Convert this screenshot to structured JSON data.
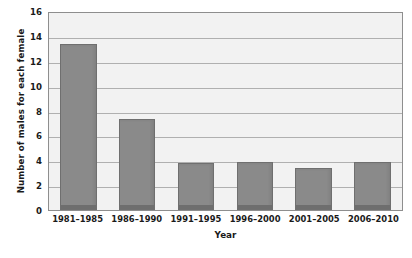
{
  "chart_data": {
    "type": "bar",
    "title": "",
    "subtitle": "",
    "xlabel": "Year",
    "ylabel": "Number of males for each female",
    "categories": [
      "1981–1985",
      "1986–1990",
      "1991–1995",
      "1996–2000",
      "2001–2005",
      "2006–2010"
    ],
    "values": [
      13.5,
      7.4,
      3.8,
      3.9,
      3.4,
      3.9
    ],
    "series": [
      {
        "name": "Males per female",
        "values": [
          13.5,
          7.4,
          3.8,
          3.9,
          3.4,
          3.9
        ]
      }
    ],
    "ylim": [
      0,
      16
    ],
    "ytick_values": [
      0,
      2,
      4,
      6,
      8,
      10,
      12,
      14,
      16
    ],
    "ytick_labels": [
      "0",
      "2",
      "4",
      "6",
      "8",
      "10",
      "12",
      "14",
      "16"
    ],
    "grid": true,
    "grid_axis": "y",
    "legend": false,
    "legend_position": "none",
    "annotations": [],
    "colors": {
      "bar_fill": "#8a8a8a",
      "bar_edge": "#6f6f6f",
      "bar_base": "#6e6e6e",
      "plot_background": "#f2f2f2",
      "figure_background": "#ffffff",
      "gridline": "#9a9a9a",
      "axis_line": "#8e8e8e",
      "text": "#1a1a1a"
    }
  }
}
